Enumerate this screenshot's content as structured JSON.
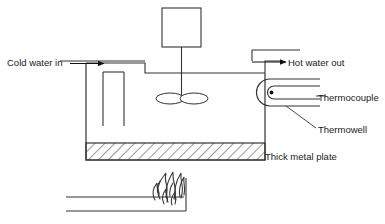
{
  "diagram": {
    "type": "process-schematic",
    "stroke_color": "#222222",
    "background_color": "#ffffff",
    "labels": {
      "cold_water_in": "Cold water in",
      "hot_water_out": "Hot water out",
      "thermocouple": "Thermocouple",
      "thermowell": "Thermowell",
      "thick_metal_plate": "Thick metal plate"
    },
    "components": [
      {
        "name": "motor",
        "shape": "rectangle"
      },
      {
        "name": "agitator-shaft",
        "shape": "vertical-line"
      },
      {
        "name": "impeller",
        "shape": "two-blade-ellipse"
      },
      {
        "name": "tank",
        "shape": "open-vessel"
      },
      {
        "name": "inlet-dip-tube",
        "shape": "pipe"
      },
      {
        "name": "outlet-pipe",
        "shape": "pipe"
      },
      {
        "name": "thermowell",
        "shape": "u-tube"
      },
      {
        "name": "thermocouple",
        "shape": "u-probe-with-tip"
      },
      {
        "name": "thick-metal-plate",
        "shape": "hatched-rectangle"
      },
      {
        "name": "burner-pipe",
        "shape": "pipe"
      },
      {
        "name": "flame",
        "shape": "fire"
      }
    ]
  }
}
